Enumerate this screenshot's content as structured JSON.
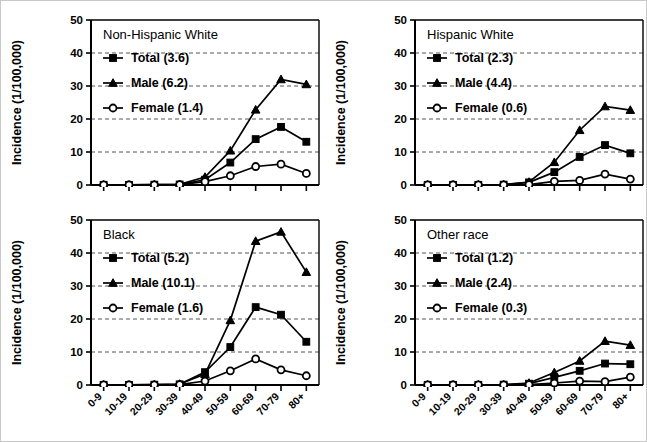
{
  "figure": {
    "name": "incidence-by-age-race-sex-panels",
    "panel_count": 4,
    "background_color": "#ffffff",
    "border_color": "#c8c8c8",
    "series_color": "#000000"
  },
  "chart_data": [
    {
      "type": "line",
      "title": "Non-Hispanic White",
      "xlabel": "",
      "ylabel": "Incidence (1/100,000)",
      "x": [
        "0-9",
        "10-19",
        "20-29",
        "30-39",
        "40-49",
        "50-59",
        "60-69",
        "70-79",
        "80+"
      ],
      "ylim": [
        0,
        50
      ],
      "yticks": [
        0,
        10,
        20,
        30,
        40,
        50
      ],
      "grid": true,
      "legend_position": "upper-left-inside",
      "series": [
        {
          "name": "Total (3.6)",
          "marker": "filled-square",
          "values": [
            0.05,
            0.05,
            0.1,
            0.15,
            1.6,
            6.8,
            13.9,
            17.6,
            13.1
          ]
        },
        {
          "name": "Male (6.2)",
          "marker": "filled-triangle",
          "values": [
            0.05,
            0.05,
            0.1,
            0.2,
            2.4,
            10.4,
            22.8,
            32.0,
            30.5
          ]
        },
        {
          "name": "Female (1.4)",
          "marker": "open-circle",
          "values": [
            0.05,
            0.05,
            0.05,
            0.1,
            1.0,
            2.8,
            5.6,
            6.3,
            3.5
          ]
        }
      ]
    },
    {
      "type": "line",
      "title": "Hispanic White",
      "xlabel": "",
      "ylabel": "Incidence (1/100,000)",
      "x": [
        "0-9",
        "10-19",
        "20-29",
        "30-39",
        "40-49",
        "50-59",
        "60-69",
        "70-79",
        "80+"
      ],
      "ylim": [
        0,
        50
      ],
      "yticks": [
        0,
        10,
        20,
        30,
        40,
        50
      ],
      "grid": true,
      "legend_position": "upper-left-inside",
      "series": [
        {
          "name": "Total (2.3)",
          "marker": "filled-square",
          "values": [
            0.05,
            0.05,
            0.05,
            0.1,
            0.8,
            3.9,
            8.5,
            12.1,
            9.6
          ]
        },
        {
          "name": "Male (4.4)",
          "marker": "filled-triangle",
          "values": [
            0.05,
            0.05,
            0.05,
            0.15,
            0.9,
            6.9,
            16.6,
            23.8,
            22.7
          ]
        },
        {
          "name": "Female (0.6)",
          "marker": "open-circle",
          "values": [
            0.05,
            0.05,
            0.05,
            0.05,
            0.1,
            1.1,
            1.4,
            3.3,
            1.8
          ]
        }
      ]
    },
    {
      "type": "line",
      "title": "Black",
      "xlabel": "Age (years)",
      "ylabel": "Incidence (1/100,000)",
      "x": [
        "0-9",
        "10-19",
        "20-29",
        "30-39",
        "40-49",
        "50-59",
        "60-69",
        "70-79",
        "80+"
      ],
      "ylim": [
        0,
        50
      ],
      "yticks": [
        0,
        10,
        20,
        30,
        40,
        50
      ],
      "grid": true,
      "legend_position": "upper-left-inside",
      "series": [
        {
          "name": "Total (5.2)",
          "marker": "filled-square",
          "values": [
            0.05,
            0.05,
            0.1,
            0.2,
            3.9,
            11.5,
            23.6,
            21.3,
            13.1
          ]
        },
        {
          "name": "Male (10.1)",
          "marker": "filled-triangle",
          "values": [
            0.05,
            0.05,
            0.1,
            0.3,
            3.3,
            19.6,
            43.6,
            46.4,
            34.2
          ]
        },
        {
          "name": "Female (1.6)",
          "marker": "open-circle",
          "values": [
            0.05,
            0.05,
            0.05,
            0.1,
            1.2,
            4.3,
            7.9,
            4.6,
            2.8
          ]
        }
      ]
    },
    {
      "type": "line",
      "title": "Other race",
      "xlabel": "Age (years)",
      "ylabel": "Incidence (1/100,000)",
      "x": [
        "0-9",
        "10-19",
        "20-29",
        "30-39",
        "40-49",
        "50-59",
        "60-69",
        "70-79",
        "80+"
      ],
      "ylim": [
        0,
        50
      ],
      "yticks": [
        0,
        10,
        20,
        30,
        40,
        50
      ],
      "grid": true,
      "legend_position": "upper-left-inside",
      "series": [
        {
          "name": "Total (1.2)",
          "marker": "filled-square",
          "values": [
            0.05,
            0.05,
            0.05,
            0.1,
            0.4,
            2.3,
            4.3,
            6.5,
            6.3
          ]
        },
        {
          "name": "Male (2.4)",
          "marker": "filled-triangle",
          "values": [
            0.05,
            0.05,
            0.05,
            0.1,
            0.6,
            3.8,
            7.3,
            13.3,
            12.1
          ]
        },
        {
          "name": "Female (0.3)",
          "marker": "open-circle",
          "values": [
            0.05,
            0.05,
            0.05,
            0.05,
            0.1,
            0.6,
            1.2,
            1.0,
            2.4
          ]
        }
      ]
    }
  ]
}
